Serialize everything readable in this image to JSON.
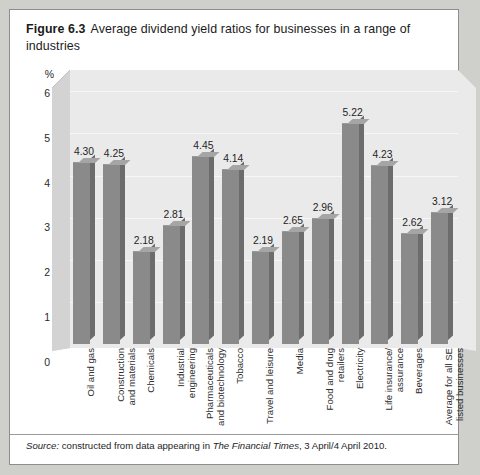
{
  "figure": {
    "number": "Figure 6.3",
    "title": "Average dividend yield ratios for businesses in a range of industries"
  },
  "source": {
    "label": "Source:",
    "text_before": " constructed from data appearing in ",
    "publication": "The Financial Times",
    "text_after": ", 3 April/4 April 2010."
  },
  "colors": {
    "bar_front": "#8a8a8a",
    "bar_side": "#6c6c6c",
    "bar_top": "#a5a5a5",
    "plot_background": "#eaeaea",
    "wall": "#d6d6d6",
    "card": "#ffffff",
    "page": "#cfcfcb"
  },
  "chart_data": {
    "type": "bar",
    "title": "Average dividend yield ratios for businesses in a range of industries",
    "xlabel": "",
    "ylabel": "%",
    "ylim": [
      0,
      6.6
    ],
    "yticks": [
      0,
      1,
      2,
      3,
      4,
      5,
      6
    ],
    "ytick_labels": [
      "0",
      "1",
      "2",
      "3",
      "4",
      "5",
      "6"
    ],
    "grid": true,
    "legend": "none",
    "categories": [
      "Oil and gas",
      "Construction and materials",
      "Chemicals",
      "Industrial engineering",
      "Pharmaceuticals and biotechnology",
      "Tobacco",
      "Travel and leisure",
      "Media",
      "Food and drug retailers",
      "Electricity",
      "Life insurance/assurance",
      "Beverages",
      "Average for all SE listed businesses"
    ],
    "category_lines": [
      "Oil and gas",
      "Construction\nand materials",
      "Chemicals",
      "Industrial\nengineering",
      "Pharmaceuticals\nand biotechnology",
      "Tobacco",
      "Travel and leisure",
      "Media",
      "Food and drug\nretailers",
      "Electricity",
      "Life insurance/\nassurance",
      "Beverages",
      "Average for all SE\nlisted businesses"
    ],
    "values": [
      4.3,
      4.25,
      2.18,
      2.81,
      4.45,
      4.14,
      2.19,
      2.65,
      2.96,
      5.22,
      4.23,
      2.62,
      3.12
    ],
    "value_labels": [
      "4.30",
      "4.25",
      "2.18",
      "2.81",
      "4.45",
      "4.14",
      "2.19",
      "2.65",
      "2.96",
      "5.22",
      "4.23",
      "2.62",
      "3.12"
    ]
  }
}
